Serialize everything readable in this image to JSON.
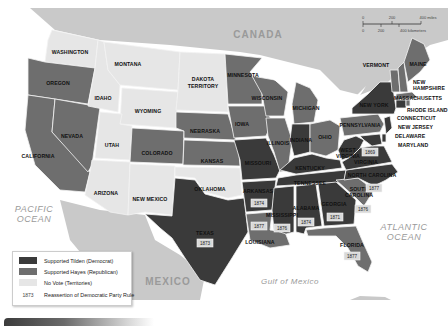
{
  "map": {
    "title": "Presidential Election of 1876",
    "labels": {
      "countries": [
        "CANADA",
        "MEXICO"
      ],
      "oceans": [
        "PACIFIC OCEAN",
        "ATLANTIC OCEAN",
        "Gulf of Mexico"
      ]
    },
    "scale_bar": {
      "miles": [
        "0",
        "200",
        "400 miles"
      ],
      "kilometers": [
        "0",
        "200",
        "400 kilometers"
      ]
    },
    "states": [
      {
        "name": "WASHINGTON",
        "category": "no_vote"
      },
      {
        "name": "OREGON",
        "category": "hayes"
      },
      {
        "name": "CALIFORNIA",
        "category": "hayes"
      },
      {
        "name": "NEVADA",
        "category": "hayes"
      },
      {
        "name": "IDAHO",
        "category": "no_vote"
      },
      {
        "name": "MONTANA",
        "category": "no_vote"
      },
      {
        "name": "WYOMING",
        "category": "no_vote"
      },
      {
        "name": "UTAH",
        "category": "no_vote"
      },
      {
        "name": "ARIZONA",
        "category": "no_vote"
      },
      {
        "name": "NEW MEXICO",
        "category": "no_vote"
      },
      {
        "name": "DAKOTA TERRITORY",
        "category": "no_vote"
      },
      {
        "name": "COLORADO",
        "category": "hayes"
      },
      {
        "name": "NEBRASKA",
        "category": "hayes"
      },
      {
        "name": "KANSAS",
        "category": "hayes"
      },
      {
        "name": "OKLAHOMA",
        "category": "no_vote"
      },
      {
        "name": "TEXAS",
        "category": "tilden",
        "year": "1873"
      },
      {
        "name": "MINNESOTA",
        "category": "hayes"
      },
      {
        "name": "IOWA",
        "category": "hayes"
      },
      {
        "name": "MISSOURI",
        "category": "tilden"
      },
      {
        "name": "ARKANSAS",
        "category": "tilden",
        "year": "1874"
      },
      {
        "name": "LOUISIANA",
        "category": "hayes",
        "year": "1877"
      },
      {
        "name": "WISCONSIN",
        "category": "hayes"
      },
      {
        "name": "ILLINOIS",
        "category": "hayes"
      },
      {
        "name": "MICHIGAN",
        "category": "hayes"
      },
      {
        "name": "INDIANA",
        "category": "tilden"
      },
      {
        "name": "OHIO",
        "category": "hayes"
      },
      {
        "name": "KENTUCKY",
        "category": "tilden"
      },
      {
        "name": "TENNESSEE",
        "category": "tilden"
      },
      {
        "name": "MISSISSIPPI",
        "category": "tilden",
        "year": "1876"
      },
      {
        "name": "ALABAMA",
        "category": "tilden",
        "year": "1874"
      },
      {
        "name": "GEORGIA",
        "category": "tilden",
        "year": "1871"
      },
      {
        "name": "FLORIDA",
        "category": "hayes",
        "year": "1877"
      },
      {
        "name": "SOUTH CAROLINA",
        "category": "hayes",
        "year": "1876"
      },
      {
        "name": "NORTH CAROLINA",
        "category": "tilden",
        "year": "1877"
      },
      {
        "name": "VIRGINIA",
        "category": "tilden"
      },
      {
        "name": "WEST VIRGINIA",
        "category": "tilden",
        "year": "1869"
      },
      {
        "name": "PENNSYLVANIA",
        "category": "hayes"
      },
      {
        "name": "NEW YORK",
        "category": "tilden"
      },
      {
        "name": "VERMONT",
        "category": "hayes"
      },
      {
        "name": "NEW HAMPSHIRE",
        "category": "hayes"
      },
      {
        "name": "MAINE",
        "category": "hayes"
      },
      {
        "name": "MASSACHUSETTS",
        "category": "hayes"
      },
      {
        "name": "RHODE ISLAND",
        "category": "hayes"
      },
      {
        "name": "CONNECTICUT",
        "category": "tilden"
      },
      {
        "name": "NEW JERSEY",
        "category": "tilden"
      },
      {
        "name": "DELAWARE",
        "category": "tilden"
      },
      {
        "name": "MARYLAND",
        "category": "tilden"
      }
    ]
  },
  "legend": {
    "items": [
      {
        "label": "Supported Tilden (Democrat)",
        "color": "#3a3a3a"
      },
      {
        "label": "Supported Hayes (Republican)",
        "color": "#6e6e6e"
      },
      {
        "label": "No Vote (Territories)",
        "color": "#e6e6e6"
      },
      {
        "label": "Reassertion of Democratic Party Rule",
        "sample_year": "1873"
      }
    ]
  },
  "colors": {
    "tilden": "#3a3a3a",
    "hayes": "#6e6e6e",
    "no_vote": "#e6e6e6",
    "foreign_land": "#c8c8c8",
    "water": "#ffffff"
  }
}
